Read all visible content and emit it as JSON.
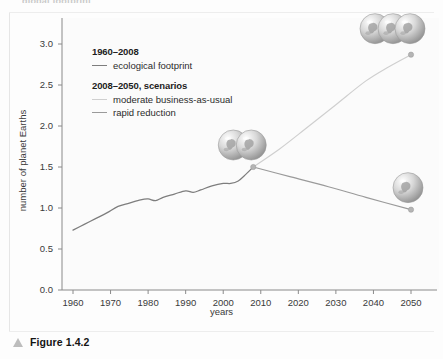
{
  "figure": {
    "clipped_heading": "global footprint",
    "caption": "Figure 1.4.2",
    "caption_marker": "triangle-icon"
  },
  "legend": {
    "groups": [
      {
        "heading": "1960–2008",
        "entries": [
          {
            "label": "ecological footprint",
            "color": "#7d7d7d",
            "key": "historical"
          }
        ]
      },
      {
        "heading": "2008–2050, scenarios",
        "entries": [
          {
            "label": "moderate business-as-usual",
            "color": "#cfcfcf",
            "key": "moderate"
          },
          {
            "label": "rapid reduction",
            "color": "#9a9a9a",
            "key": "rapid"
          }
        ]
      }
    ]
  },
  "chart_data": {
    "type": "line",
    "title": "",
    "xlabel": "years",
    "ylabel": "number of planet Earths",
    "xlim": [
      1958,
      2054
    ],
    "ylim": [
      0.0,
      3.1
    ],
    "xticks": [
      1960,
      1970,
      1980,
      1990,
      2000,
      2010,
      2020,
      2030,
      2040,
      2050
    ],
    "yticks": [
      0.0,
      0.5,
      1.0,
      1.5,
      2.0,
      2.5,
      3.0
    ],
    "ytick_labels": [
      "0.0",
      "0.5",
      "1.0",
      "1.5",
      "2.0",
      "2.5",
      "3.0"
    ],
    "xtick_labels": [
      "1960",
      "1970",
      "1980",
      "1990",
      "2000",
      "2010",
      "2020",
      "2030",
      "2040",
      "2050"
    ],
    "grid": false,
    "legend_position": "upper-left-inside",
    "series": [
      {
        "name": "ecological footprint",
        "key": "historical",
        "color": "#7d7d7d",
        "period": "1960–2008",
        "x": [
          1960,
          1963,
          1966,
          1969,
          1972,
          1975,
          1978,
          1980,
          1982,
          1984,
          1987,
          1990,
          1992,
          1994,
          1997,
          2000,
          2002,
          2004,
          2006,
          2008
        ],
        "y": [
          0.73,
          0.8,
          0.87,
          0.94,
          1.02,
          1.06,
          1.1,
          1.11,
          1.09,
          1.13,
          1.17,
          1.21,
          1.19,
          1.22,
          1.27,
          1.3,
          1.3,
          1.33,
          1.41,
          1.5
        ]
      },
      {
        "name": "moderate business-as-usual",
        "key": "moderate",
        "color": "#cfcfcf",
        "period": "2008–2050",
        "x": [
          2008,
          2015,
          2022,
          2030,
          2038,
          2044,
          2050
        ],
        "y": [
          1.5,
          1.72,
          1.97,
          2.26,
          2.55,
          2.72,
          2.87
        ]
      },
      {
        "name": "rapid reduction",
        "key": "rapid",
        "color": "#9a9a9a",
        "period": "2008–2050",
        "x": [
          2008,
          2018,
          2028,
          2038,
          2050
        ],
        "y": [
          1.5,
          1.38,
          1.26,
          1.13,
          0.98
        ]
      }
    ],
    "endpoint_markers": [
      {
        "name": "branch-point-2008",
        "x": 2008,
        "y": 1.5,
        "globes": 2
      },
      {
        "name": "moderate-endpoint-2050",
        "x": 2050,
        "y": 2.87,
        "globes": 3
      },
      {
        "name": "rapid-endpoint-2050",
        "x": 2050,
        "y": 0.98,
        "globes": 1
      }
    ]
  }
}
